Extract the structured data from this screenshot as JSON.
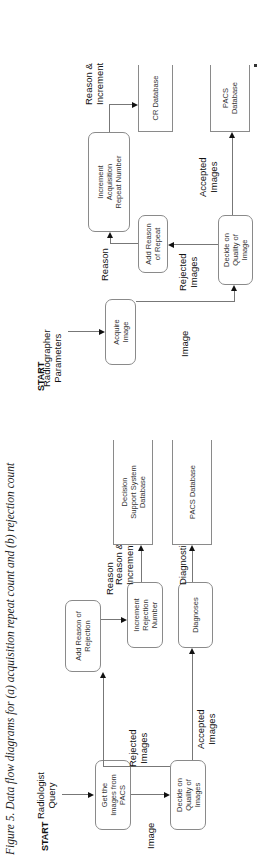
{
  "caption": "Figure 5. Data flow diagrams for (a) acquisition repeat count and (b) rejection count",
  "diagram_a": {
    "start": "START",
    "input_label": "Radiographer\nParameters",
    "nodes": {
      "acquire": "Acquire\nImage",
      "decide": "Decide on\nQuality of\nImage",
      "add_reason": "Add Reason\nof Repeat",
      "increment": "Increment\nAcquisition\nRepeat Number",
      "cr_db": "CR Database",
      "pacs_db": "PACS\nDatabase"
    },
    "flows": {
      "image": "Image",
      "rejected": "Rejected\nImages",
      "reason": "Reason",
      "reason_increment": "Reason &\nIncrement",
      "accepted": "Accepted\nImages"
    }
  },
  "diagram_b": {
    "start": "START",
    "input_label": "Radiologist\nQuery",
    "nodes": {
      "get_images": "Get the\nImages from\nPACS",
      "decide": "Decide on\nQuality of\nImages",
      "add_reason": "Add Reason of\nRejection",
      "increment": "Increment\nRejection\nNumber",
      "diagnoses": "Diagnoses",
      "dss_db": "Decision\nSupport System\nDatabase",
      "pacs_db": "PACS Database"
    },
    "flows": {
      "image": "Image",
      "rejected": "Rejected\nImages",
      "accepted": "Accepted\nImages",
      "reason": "Reason",
      "reason_increment": "Reason &\nIncrement",
      "diagnostic": "Diagnostic"
    }
  }
}
